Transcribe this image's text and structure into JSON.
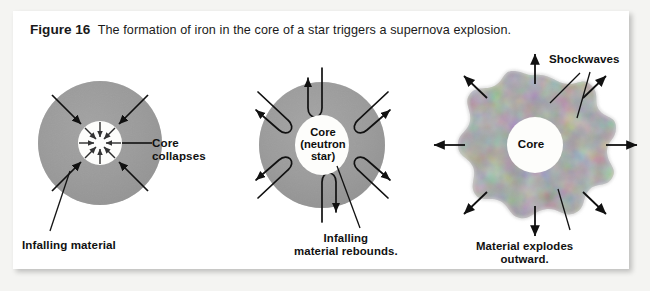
{
  "figure": {
    "number_label": "Figure 16",
    "caption": "The formation of iron in the core of a star triggers a supernova explosion."
  },
  "panels": [
    {
      "id": "panel-collapse",
      "name": "core-collapse",
      "star_fill": "#9a9a9a",
      "core_fill": "#fdfdfb",
      "core_label": "",
      "callouts": [
        {
          "name": "core-collapses",
          "text": "Core\ncollapses",
          "line1": "Core",
          "line2": "collapses"
        },
        {
          "name": "infalling-material",
          "text": "Infalling material",
          "line1": "Infalling material",
          "line2": ""
        }
      ],
      "arrow_direction": "inward",
      "arrow_count_outer": 4,
      "arrow_count_inner": 8
    },
    {
      "id": "panel-rebound",
      "name": "neutron-star-rebound",
      "star_fill": "#9a9a9a",
      "core_fill": "#fdfdfb",
      "core_label_line1": "Core",
      "core_label_line2": "(neutron",
      "core_label_line3": "star)",
      "callouts": [
        {
          "name": "infalling-material-rebounds",
          "line1": "Infalling",
          "line2": "material rebounds."
        }
      ],
      "arrow_direction": "rebound",
      "arrow_count": 8
    },
    {
      "id": "panel-explosion",
      "name": "supernova-explosion",
      "star_fill": "#a2a2a2",
      "core_fill": "#fdfdfb",
      "core_label": "Core",
      "callouts": [
        {
          "name": "shockwaves",
          "text": "Shockwaves"
        },
        {
          "name": "material-explodes-outward",
          "line1": "Material explodes",
          "line2": "outward."
        }
      ],
      "arrow_direction": "outward",
      "arrow_count": 8
    }
  ],
  "labels": {
    "core_collapses_l1": "Core",
    "core_collapses_l2": "collapses",
    "infalling_material": "Infalling material",
    "infalling_rebounds_l1": "Infalling",
    "infalling_rebounds_l2": "material rebounds.",
    "shockwaves": "Shockwaves",
    "material_explodes_l1": "Material explodes",
    "material_explodes_l2": "outward.",
    "core_neutron_l1": "Core",
    "core_neutron_l2": "(neutron",
    "core_neutron_l3": "star)",
    "core_plain": "Core"
  },
  "colors": {
    "page_background": "#f4f4f2",
    "card_background": "#ffffff",
    "star_gray": "#9a9a9a",
    "core_white": "#fdfdfb",
    "ink": "#111111"
  }
}
